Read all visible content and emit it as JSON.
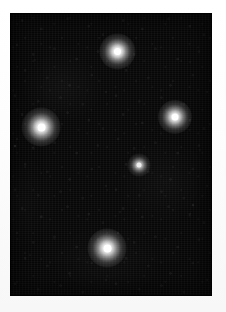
{
  "image": {
    "title": "Star field photograph",
    "description": "Dark astronomical night-sky photograph showing a bright five-star asterism on a grainy black background, printed with a white border.",
    "width": 226,
    "height": 312,
    "border": {
      "color": "#fdfdfd",
      "left": 10,
      "top": 13,
      "right": 14,
      "bottom": 16
    },
    "sky": {
      "frame_x": 10,
      "frame_y": 13,
      "frame_width": 202,
      "frame_height": 283,
      "background_color": "#070707",
      "noise_color": "#1c1c1c",
      "noise_description": "fine film grain / sensor noise speckle"
    },
    "stars": [
      {
        "name": "star-top",
        "x": 117,
        "y": 51,
        "core_diameter": 7,
        "halo_diameter": 19,
        "brightness": 1.0,
        "color": "#ffffff"
      },
      {
        "name": "star-left",
        "x": 41,
        "y": 127,
        "core_diameter": 8,
        "halo_diameter": 21,
        "brightness": 1.0,
        "color": "#ffffff"
      },
      {
        "name": "star-right",
        "x": 175,
        "y": 117,
        "core_diameter": 7,
        "halo_diameter": 18,
        "brightness": 0.95,
        "color": "#ffffff"
      },
      {
        "name": "star-center",
        "x": 139,
        "y": 165,
        "core_diameter": 5,
        "halo_diameter": 12,
        "brightness": 0.72,
        "color": "#f2f2f2"
      },
      {
        "name": "star-bottom",
        "x": 107,
        "y": 248,
        "core_diameter": 8,
        "halo_diameter": 21,
        "brightness": 1.0,
        "color": "#ffffff"
      }
    ],
    "faint_stars": [
      {
        "name": "faint-star-left-edge",
        "x": 15,
        "y": 146,
        "diameter": 3,
        "brightness": 0.22
      },
      {
        "name": "faint-star-right-lower",
        "x": 193,
        "y": 205,
        "diameter": 3,
        "brightness": 0.14
      },
      {
        "name": "faint-star-mid-lower",
        "x": 120,
        "y": 212,
        "diameter": 2,
        "brightness": 0.12
      },
      {
        "name": "faint-star-upper-left",
        "x": 35,
        "y": 60,
        "diameter": 2,
        "brightness": 0.1
      },
      {
        "name": "faint-star-upper-right",
        "x": 190,
        "y": 62,
        "diameter": 2,
        "brightness": 0.1
      },
      {
        "name": "faint-star-lower-left",
        "x": 30,
        "y": 255,
        "diameter": 2,
        "brightness": 0.1
      },
      {
        "name": "faint-star-right-mid",
        "x": 200,
        "y": 150,
        "diameter": 2,
        "brightness": 0.1
      }
    ],
    "star_count": 5,
    "faint_star_count": 7
  }
}
